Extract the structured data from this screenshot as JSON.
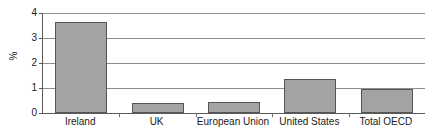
{
  "chart_data": {
    "type": "bar",
    "title": "",
    "subtitle": "",
    "xlabel": "",
    "ylabel": "%",
    "categories": [
      "Ireland",
      "UK",
      "European Union",
      "United States",
      "Total OECD"
    ],
    "values": [
      3.65,
      0.4,
      0.45,
      1.35,
      0.95
    ],
    "series": [
      {
        "name": "",
        "values": [
          3.65,
          0.4,
          0.45,
          1.35,
          0.95
        ]
      }
    ],
    "ylim": [
      0,
      4
    ],
    "yticks": [
      0,
      1,
      2,
      3,
      4
    ],
    "ytick_labels": [
      "0",
      "1",
      "2",
      "3",
      "4"
    ],
    "grid": true,
    "legend": false,
    "legend_position": "none",
    "bar_color": "#a3a3a3",
    "bar_border_color": "#555555",
    "gridline_color": "#8d8d8d",
    "axis_color": "#5a5a5a",
    "background_color": "#ffffff"
  }
}
